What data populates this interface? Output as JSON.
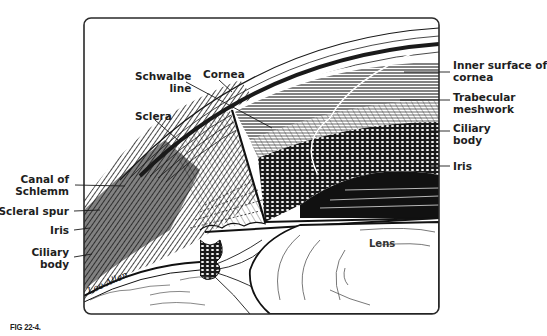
{
  "figure": {
    "caption": "FIG 22-4.",
    "signature": "Lee Allen",
    "colors": {
      "ink": "#1a1a1a",
      "paper": "#ffffff",
      "frame": "#2a2a2a"
    }
  },
  "labels": {
    "left": [
      {
        "id": "canal-of-schlemm",
        "lines": [
          "Canal of",
          "Schlemm"
        ]
      },
      {
        "id": "scleral-spur",
        "lines": [
          "Scleral spur"
        ]
      },
      {
        "id": "iris-left",
        "lines": [
          "Iris"
        ]
      },
      {
        "id": "ciliary-body-left",
        "lines": [
          "Ciliary",
          "body"
        ]
      }
    ],
    "top": [
      {
        "id": "schwalbe-line",
        "lines": [
          "Schwalbe",
          "line"
        ]
      },
      {
        "id": "cornea",
        "lines": [
          "Cornea"
        ]
      },
      {
        "id": "sclera",
        "lines": [
          "Sclera"
        ]
      }
    ],
    "right": [
      {
        "id": "inner-surface-of-cornea",
        "lines": [
          "Inner surface of",
          "cornea"
        ]
      },
      {
        "id": "trabecular-meshwork",
        "lines": [
          "Trabecular",
          "meshwork"
        ]
      },
      {
        "id": "ciliary-body-right",
        "lines": [
          "Ciliary",
          "body"
        ]
      },
      {
        "id": "iris-right",
        "lines": [
          "Iris"
        ]
      }
    ],
    "center": [
      {
        "id": "lens",
        "lines": [
          "Lens"
        ]
      }
    ]
  }
}
